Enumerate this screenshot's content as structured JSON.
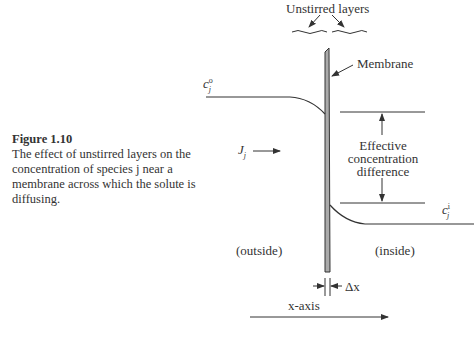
{
  "figure": {
    "number_label": "Figure 1.10",
    "caption": "The effect of unstirred layers on the concentration of species j near a membrane across which the solute is diffusing."
  },
  "diagram": {
    "unstirred_layers_label": "Unstirred layers",
    "membrane_label": "Membrane",
    "c_outside_label": {
      "base": "c",
      "sub": "j",
      "sup": "o"
    },
    "c_inside_label": {
      "base": "c",
      "sub": "j",
      "sup": "i"
    },
    "flux_label": {
      "base": "J",
      "sub": "j"
    },
    "effective_difference_label": [
      "Effective",
      "concentration",
      "difference"
    ],
    "outside_label": "(outside)",
    "inside_label": "(inside)",
    "delta_x_label": "Δx",
    "x_axis_label": "x-axis"
  },
  "colors": {
    "line": "#333333",
    "membrane_fill": "#aaaaaa"
  }
}
